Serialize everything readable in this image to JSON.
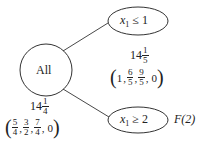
{
  "diagram": {
    "type": "branch-and-bound-tree",
    "nodes": [
      {
        "id": "root",
        "label": "All",
        "shape": "circle",
        "value": {
          "whole": "14",
          "num": "1",
          "den": "4"
        },
        "solution": [
          {
            "num": "5",
            "den": "4"
          },
          {
            "num": "3",
            "den": "2"
          },
          {
            "num": "7",
            "den": "4"
          },
          {
            "plain": "0"
          }
        ]
      },
      {
        "id": "left-branch",
        "label_var": "x",
        "label_sub": "1",
        "label_rel": " ≤ 1",
        "shape": "ellipse",
        "value": {
          "whole": "14",
          "num": "1",
          "den": "5"
        },
        "solution": [
          {
            "plain": "1"
          },
          {
            "num": "6",
            "den": "5"
          },
          {
            "num": "9",
            "den": "5"
          },
          {
            "plain": "0"
          }
        ]
      },
      {
        "id": "right-branch",
        "label_var": "x",
        "label_sub": "1",
        "label_rel": " ≥ 2",
        "shape": "ellipse",
        "status": "F(2)"
      }
    ],
    "edges": [
      {
        "from": "root",
        "to": "left-branch"
      },
      {
        "from": "root",
        "to": "right-branch"
      }
    ]
  }
}
